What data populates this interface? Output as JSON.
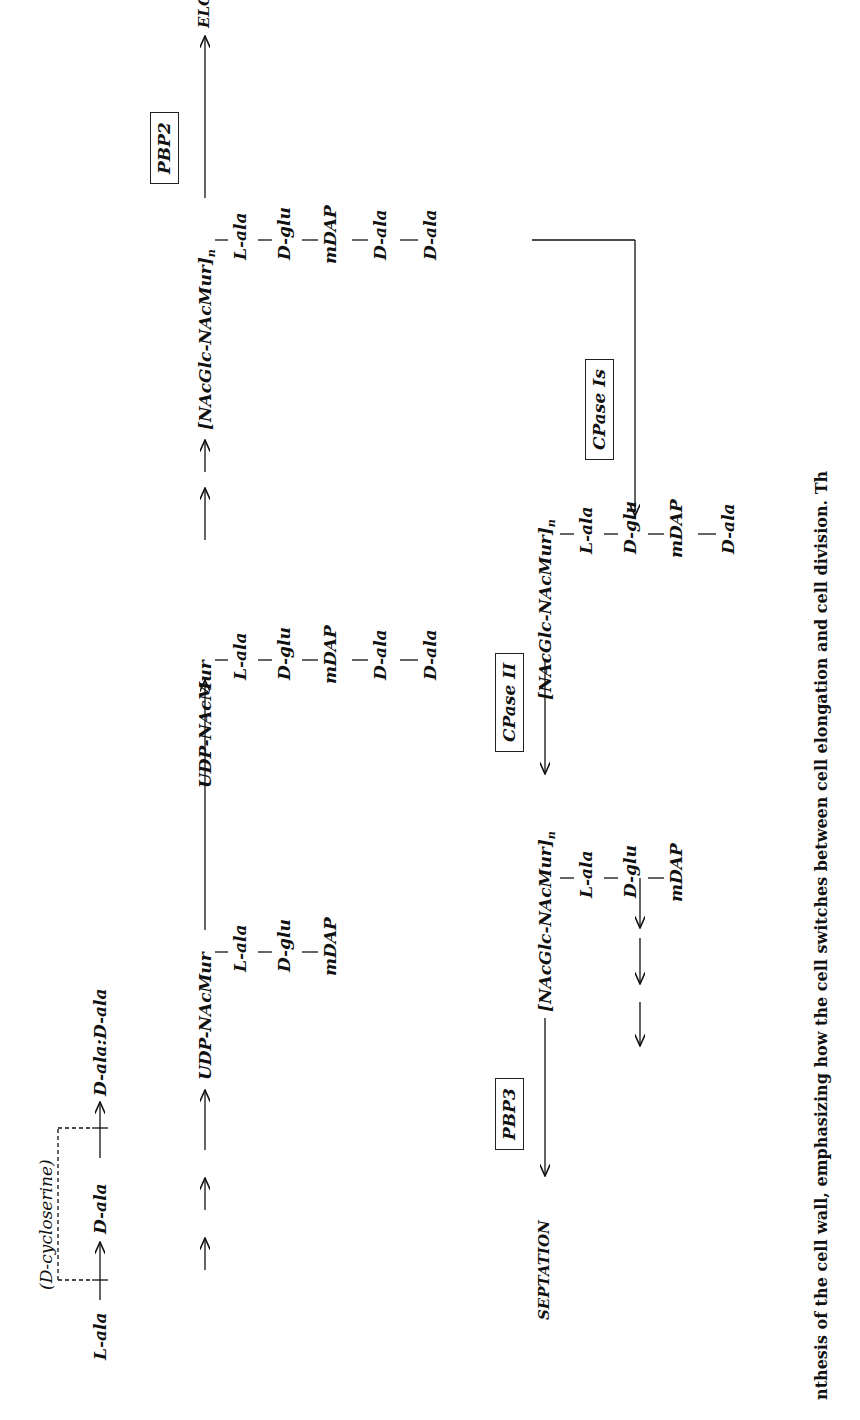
{
  "diagram": {
    "precursors": {
      "l_ala": "L-ala",
      "d_ala": "D-ala",
      "d_ala_dipeptide": "D-ala:D-ala",
      "inhibitor": "(D-cycloserine)"
    },
    "udp_short": {
      "head": "UDP-NAcMur",
      "chain": [
        "L-ala",
        "D-glu",
        "mDAP"
      ]
    },
    "udp_long": {
      "head": "UDP-NAcMur",
      "chain": [
        "L-ala",
        "D-glu",
        "mDAP",
        "D-ala",
        "D-ala"
      ]
    },
    "polymer_pentapeptide": {
      "head": "[NAcGlc-NAcMur]",
      "subscript": "n",
      "chain": [
        "L-ala",
        "D-glu",
        "mDAP",
        "D-ala",
        "D-ala"
      ]
    },
    "polymer_tetrapeptide": {
      "head": "[NAcGlc-NAcMur]",
      "subscript": "n",
      "chain": [
        "L-ala",
        "D-glu",
        "mDAP",
        "D-ala"
      ]
    },
    "polymer_tripeptide": {
      "head": "[NAcGlc-NAcMur]",
      "subscript": "n",
      "chain": [
        "L-ala",
        "D-glu",
        "mDAP"
      ]
    },
    "enzymes": {
      "pbp2": "PBP2",
      "pbp3": "PBP3",
      "cpase_is": "CPase Is",
      "cpase_ii": "CPase II"
    },
    "outcomes": {
      "elongation": "ELONGATION",
      "septation": "SEPTATION"
    },
    "caption_fragment": "nthesis of the cell wall, emphasizing how the cell switches between cell elongation and cell division. Th"
  }
}
